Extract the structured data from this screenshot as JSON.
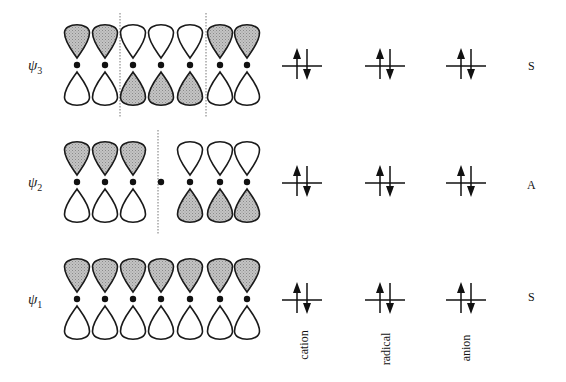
{
  "diagram": {
    "colors": {
      "shaded_lobe": "#b8b8b8",
      "outline": "#1a1a1a",
      "node_line": "#777777",
      "background": "#ffffff"
    },
    "columns": [
      {
        "id": "cation",
        "label": "cation",
        "x": 302
      },
      {
        "id": "radical",
        "label": "radical",
        "x": 385
      },
      {
        "id": "anion",
        "label": "anion",
        "x": 466
      }
    ],
    "orbital_x": [
      77,
      105,
      133,
      161,
      190,
      220,
      247
    ],
    "rows": [
      {
        "id": "psi3",
        "label": "ψ",
        "subscript": "3",
        "symmetry": "S",
        "y_center": 65,
        "top_shaded": [
          true,
          true,
          false,
          false,
          false,
          true,
          true
        ],
        "nodes_x": [
          120,
          206
        ],
        "central_dot_only": false,
        "occupancy": [
          "↑↓",
          "↑↓",
          "↑↓"
        ]
      },
      {
        "id": "psi2",
        "label": "ψ",
        "subscript": "2",
        "symmetry": "A",
        "y_center": 182,
        "top_shaded": [
          true,
          true,
          true,
          null,
          false,
          false,
          false
        ],
        "nodes_x": [
          158
        ],
        "central_dot_only": true,
        "occupancy": [
          "↑↓",
          "↑↓",
          "↑↓"
        ]
      },
      {
        "id": "psi1",
        "label": "ψ",
        "subscript": "1",
        "symmetry": "S",
        "y_center": 299,
        "top_shaded": [
          true,
          true,
          true,
          true,
          true,
          true,
          true
        ],
        "nodes_x": [],
        "central_dot_only": false,
        "occupancy": [
          "↑↓",
          "↑↓",
          "↑↓"
        ]
      }
    ]
  }
}
